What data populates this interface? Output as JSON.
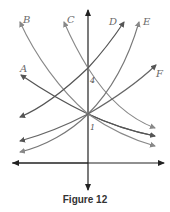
{
  "caption": "Figure 12",
  "axis": {
    "y_point_upper_label": "4",
    "y_point_lower_label": "1"
  },
  "curves": [
    {
      "label": "A",
      "color": "#555555"
    },
    {
      "label": "B",
      "color": "#888888"
    },
    {
      "label": "C",
      "color": "#888888"
    },
    {
      "label": "D",
      "color": "#555555"
    },
    {
      "label": "E",
      "color": "#777777"
    },
    {
      "label": "F",
      "color": "#666666"
    }
  ],
  "colors": {
    "axis": "#222222",
    "background": "#ffffff"
  }
}
